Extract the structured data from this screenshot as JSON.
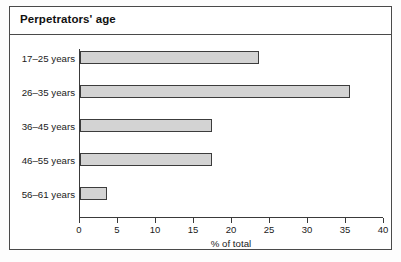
{
  "chart_data": {
    "type": "bar",
    "orientation": "horizontal",
    "title": "Perpetrators' age",
    "categories": [
      "17–25 years",
      "26–35 years",
      "36–45 years",
      "46–55 years",
      "56–61 years"
    ],
    "values": [
      23.7,
      35.6,
      17.5,
      17.5,
      3.7
    ],
    "xlabel": "% of total",
    "ylabel": "",
    "xlim": [
      0,
      40
    ],
    "xticks": [
      0,
      5,
      10,
      15,
      20,
      25,
      30,
      35,
      40
    ],
    "xtick_labels": [
      "0",
      "5",
      "10",
      "15",
      "20",
      "25",
      "30",
      "35",
      "40"
    ],
    "grid": false,
    "legend": false,
    "bar_fill_color": "#d3d3d3",
    "bar_border_color": "#3c3c3c",
    "frame_color": "#4a4a4a",
    "background_color": "#ffffff"
  }
}
